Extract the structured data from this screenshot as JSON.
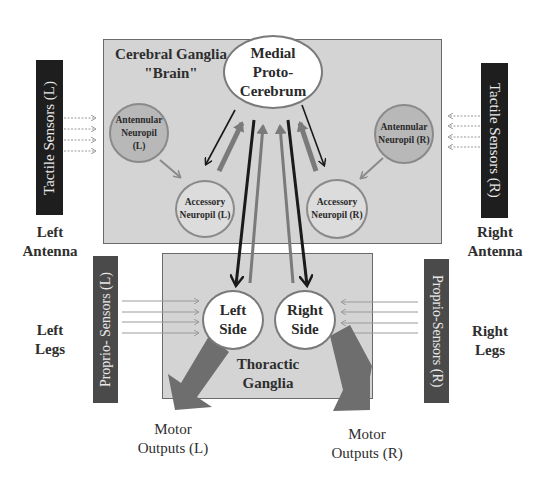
{
  "cerebral_ganglia": {
    "title_line1": "Cerebral Ganglia",
    "title_line2": "\"Brain\"",
    "medial": {
      "line1": "Medial",
      "line2": "Proto-",
      "line3": "Cerebrum"
    },
    "antennular_left": {
      "line1": "Antennular",
      "line2": "Neuropil",
      "line3": "(L)"
    },
    "antennular_right": {
      "line1": "Antennular",
      "line2": "Neuropil (R)"
    },
    "accessory_left": {
      "line1": "Accessory",
      "line2": "Neuropil (L)"
    },
    "accessory_right": {
      "line1": "Accessory",
      "line2": "Neuropil (R)"
    }
  },
  "thoracic_ganglia": {
    "title_line1": "Thoractic",
    "title_line2": "Ganglia",
    "left_side": {
      "line1": "Left",
      "line2": "Side"
    },
    "right_side": {
      "line1": "Right",
      "line2": "Side"
    }
  },
  "sensors": {
    "tactile_left": "Tactile Sensors (L)",
    "tactile_right": "Tactile Sensors (R)",
    "proprio_left": "Proprio- Sensors (L)",
    "proprio_right": "Proprio-Sensors (R)"
  },
  "labels": {
    "left_antenna": {
      "line1": "Left",
      "line2": "Antenna"
    },
    "right_antenna": {
      "line1": "Right",
      "line2": "Antenna"
    },
    "left_legs": {
      "line1": "Left",
      "line2": "Legs"
    },
    "right_legs": {
      "line1": "Right",
      "line2": "Legs"
    },
    "motor_left": {
      "line1": "Motor",
      "line2": "Outputs (L)"
    },
    "motor_right": {
      "line1": "Motor",
      "line2": "Outputs (R)"
    }
  },
  "colors": {
    "box_fill": "#d4d4d4",
    "sensor_dark": "#1e1e1e",
    "sensor_gray": "#4a4a4a",
    "arrow_dark": "#1a1a1a",
    "arrow_gray": "#7a7a7a",
    "motor_arrow": "#6e6e6e"
  }
}
